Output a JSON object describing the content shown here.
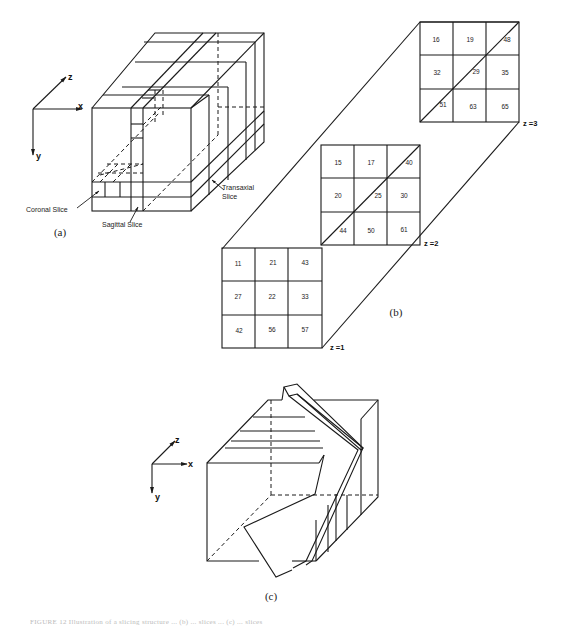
{
  "figure": {
    "caption": "FIGURE 12   Illustration of a slicing structure ... (b) ... slices ... (c) ... slices",
    "ink_color": "#1a1a1a",
    "background": "#ffffff"
  },
  "panel_a": {
    "label": "(a)",
    "axes": {
      "x": "x",
      "y": "y",
      "z": "z"
    },
    "annotations": {
      "coronal": "Coronal Slice",
      "sagittal": "Sagittal Slice",
      "transaxial_line1": "Transaxial",
      "transaxial_line2": "Slice"
    }
  },
  "panel_b": {
    "label": "(b)",
    "slices": [
      {
        "label": "z =1",
        "values": [
          [
            11,
            21,
            43
          ],
          [
            27,
            22,
            33
          ],
          [
            42,
            56,
            57
          ]
        ]
      },
      {
        "label": "z =2",
        "values": [
          [
            15,
            17,
            40
          ],
          [
            20,
            25,
            30
          ],
          [
            44,
            50,
            61
          ]
        ]
      },
      {
        "label": "z =3",
        "values": [
          [
            16,
            19,
            48
          ],
          [
            32,
            29,
            35
          ],
          [
            51,
            63,
            65
          ]
        ]
      }
    ]
  },
  "panel_c": {
    "label": "(c)",
    "axes": {
      "x": "x",
      "y": "y",
      "z": "z"
    }
  }
}
